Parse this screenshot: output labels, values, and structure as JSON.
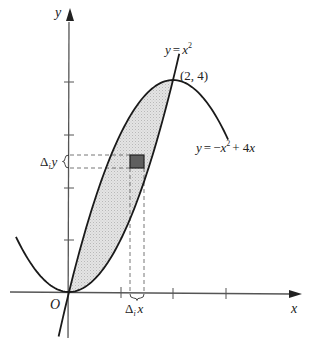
{
  "figure": {
    "axes": {
      "x_label": "x",
      "y_label": "y",
      "origin_label": "O",
      "x_ticks": [
        1,
        2,
        3
      ],
      "y_ticks": [
        1,
        2,
        3,
        4
      ]
    },
    "curves": [
      {
        "name": "lower-parabola",
        "equation_label": "y = x²",
        "lhs": "y",
        "eq": "=",
        "var": "x",
        "exp": "2"
      },
      {
        "name": "upper-parabola",
        "equation_label": "y = −x² + 4x",
        "lhs": "y",
        "eq": "=",
        "neg": "−",
        "var": "x",
        "exp": "2",
        "rest": "+ 4",
        "var2": "x"
      }
    ],
    "intersection_point": {
      "label": "(2, 4)",
      "x": 2,
      "y": 4
    },
    "element": {
      "delta_x_label": {
        "delta": "Δ",
        "sub": "i",
        "var": "x"
      },
      "delta_y_label": {
        "delta": "Δ",
        "sub": "i",
        "var": "y"
      }
    },
    "shaded_region": "area between y = x² and y = −x² + 4x for 0 ≤ x ≤ 2",
    "colors": {
      "axis": "#555555",
      "curve": "#1a1a1a",
      "shade": "#dcdcdc",
      "element": "#5a5a5a",
      "dash": "#666666"
    }
  }
}
